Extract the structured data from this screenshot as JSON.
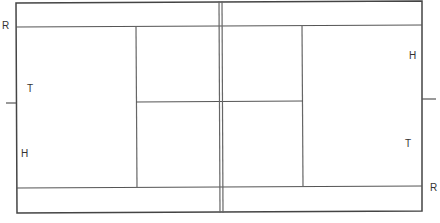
{
  "diagram": {
    "type": "tennis-court",
    "colors": {
      "line": "#444444",
      "net": "#666666",
      "background": "#ffffff",
      "text": "#333333"
    },
    "labels": {
      "left_R": "R",
      "left_T": "T",
      "left_H": "H",
      "right_H": "H",
      "right_T": "T",
      "right_R": "R"
    }
  }
}
